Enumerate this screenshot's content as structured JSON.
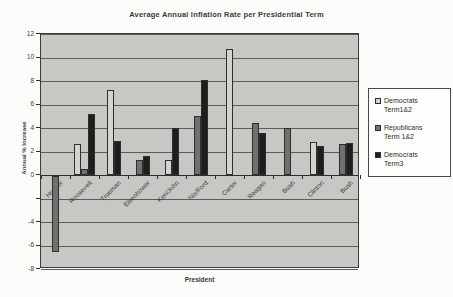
{
  "chart_data": {
    "type": "bar",
    "title": "Average Annual Inflation Rate per Presidential Term",
    "xlabel": "President",
    "ylabel": "Annual % Increase",
    "ylim": [
      -8,
      12
    ],
    "grid": true,
    "legend_position": "right",
    "plot_bg_color": "#c7c7c3",
    "categories": [
      "Hoover",
      "Roosevelt",
      "Trueman",
      "Eisenhower",
      "Ken/John",
      "Nix/Ford",
      "Carter",
      "Reagan",
      "Bush",
      "Clinton",
      "Bush"
    ],
    "series": [
      {
        "name": "Democrats Term1&2",
        "label_lines": [
          "Democrats",
          "Term1&2"
        ],
        "color": "#d4d3cd",
        "values": [
          null,
          2.6,
          7.2,
          null,
          1.3,
          null,
          10.7,
          null,
          null,
          2.8,
          null
        ]
      },
      {
        "name": "Republicans Term 1&2",
        "label_lines": [
          "Republicans",
          "Term 1&2"
        ],
        "color": "#70706c",
        "values": [
          -6.5,
          0.5,
          null,
          1.3,
          null,
          5.0,
          null,
          4.4,
          4.0,
          null,
          2.6
        ]
      },
      {
        "name": "Democrats Term3",
        "label_lines": [
          "Democrats",
          "Term3"
        ],
        "color": "#1e1e1c",
        "values": [
          null,
          5.2,
          2.9,
          1.6,
          4.0,
          8.1,
          null,
          3.6,
          null,
          2.5,
          2.7
        ]
      }
    ],
    "yticks": [
      {
        "v": 12,
        "label": "12"
      },
      {
        "v": 10,
        "label": "10"
      },
      {
        "v": 8,
        "label": "8"
      },
      {
        "v": 6,
        "label": "6"
      },
      {
        "v": 4,
        "label": "4"
      },
      {
        "v": 2,
        "label": "2"
      },
      {
        "v": 0,
        "label": "0"
      },
      {
        "v": -2,
        "label": ""
      },
      {
        "v": -4,
        "label": "-4"
      },
      {
        "v": -6,
        "label": "-6"
      },
      {
        "v": -8,
        "label": "-8"
      }
    ]
  }
}
